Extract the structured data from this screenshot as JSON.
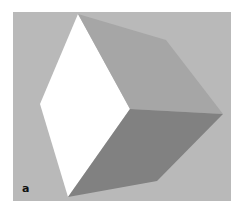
{
  "figure": {
    "panel_label": "a",
    "colors": {
      "background": "#b9b9b9",
      "face_left": "#ffffff",
      "face_top": "#a6a6a6",
      "face_bottom": "#818181"
    },
    "vertices": {
      "top": [
        78,
        14
      ],
      "top_right": [
        166,
        40
      ],
      "right": [
        223,
        114
      ],
      "bottom_right": [
        157,
        181
      ],
      "bottom": [
        68,
        197
      ],
      "left": [
        40,
        104
      ],
      "center": [
        130,
        109
      ]
    }
  }
}
